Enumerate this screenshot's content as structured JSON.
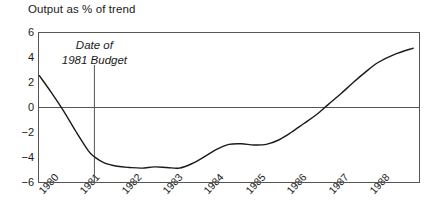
{
  "chart_data": {
    "type": "line",
    "title": "Output as % of trend",
    "xlabel": "",
    "ylabel": "",
    "xlim": [
      1979.8,
      1989.0
    ],
    "ylim": [
      -6,
      6
    ],
    "yticks": [
      6,
      4,
      2,
      0,
      -2,
      -4,
      -6
    ],
    "ytick_labels": [
      "6",
      "4",
      "2",
      "0",
      "−2",
      "−4",
      "−6"
    ],
    "xticks": [
      1980,
      1981,
      1982,
      1983,
      1984,
      1985,
      1986,
      1987,
      1988
    ],
    "xtick_labels": [
      "1980",
      "1981",
      "1982",
      "1983",
      "1984",
      "1985",
      "1986",
      "1987",
      "1988"
    ],
    "grid": false,
    "legend": false,
    "zero_line": 0,
    "annotations": [
      {
        "name": "date-of-1981-budget",
        "lines": [
          "Date of",
          "1981 Budget"
        ],
        "x": 1981.15,
        "style": "italic",
        "vertical_line_from": 3.4,
        "vertical_line_to": -6
      }
    ],
    "series": [
      {
        "name": "Output as % of trend",
        "color": "#1a1a1a",
        "x": [
          1979.82,
          1980.1,
          1980.4,
          1980.7,
          1981.0,
          1981.15,
          1981.4,
          1981.7,
          1982.0,
          1982.3,
          1982.6,
          1982.9,
          1983.2,
          1983.5,
          1983.8,
          1984.1,
          1984.4,
          1984.7,
          1985.0,
          1985.3,
          1985.6,
          1985.9,
          1986.2,
          1986.5,
          1986.8,
          1987.1,
          1987.4,
          1987.7,
          1988.0,
          1988.4,
          1988.85
        ],
        "y": [
          2.55,
          1.25,
          -0.25,
          -1.9,
          -3.45,
          -3.95,
          -4.45,
          -4.7,
          -4.8,
          -4.85,
          -4.75,
          -4.8,
          -4.85,
          -4.5,
          -3.95,
          -3.35,
          -2.95,
          -2.9,
          -3.0,
          -2.95,
          -2.6,
          -2.0,
          -1.3,
          -0.6,
          0.25,
          1.1,
          2.0,
          2.85,
          3.6,
          4.25,
          4.75
        ]
      }
    ]
  },
  "axes": {
    "frame_color": "#555555",
    "zero_line_color": "#555555",
    "line_color": "#1a1a1a"
  }
}
